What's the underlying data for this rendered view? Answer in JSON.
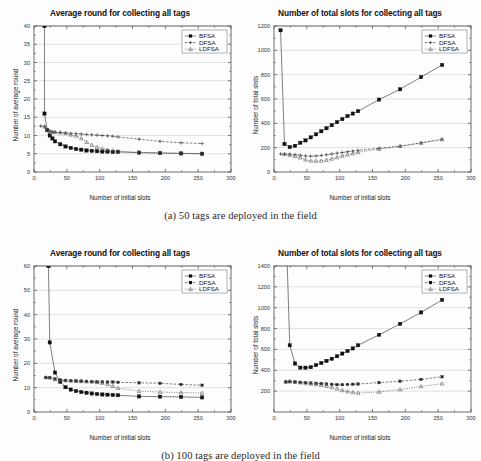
{
  "figure": {
    "caption_a": "(a)  50 tags are deployed in the field",
    "caption_b": "(b) 100 tags are deployed in the field",
    "xlabel": "Number of initial slots",
    "legend": [
      "BFSA",
      "DFSA",
      "LDFSA"
    ],
    "title_round": "Average round for collecting all tags",
    "title_slots": "Number of total slots for collecting all tags",
    "ylabel_round": "Number of average round",
    "ylabel_slots": "Number of total slots"
  },
  "chart_data": [
    {
      "id": "a-left",
      "type": "line",
      "title": "Average round for collecting all tags",
      "xlabel": "Number of initial slots",
      "ylabel": "Number of average round",
      "xlim": [
        0,
        300
      ],
      "ylim": [
        0,
        40
      ],
      "xticks": [
        0,
        50,
        100,
        150,
        200,
        250,
        300
      ],
      "yticks": [
        0,
        5,
        10,
        15,
        20,
        25,
        30,
        35,
        40
      ],
      "grid": true,
      "legend_position": "top-right",
      "series": [
        {
          "name": "BFSA",
          "marker": "filled-square",
          "x": [
            16,
            16,
            20,
            24,
            28,
            32,
            40,
            48,
            56,
            64,
            72,
            80,
            88,
            96,
            104,
            112,
            120,
            128,
            160,
            192,
            224,
            256
          ],
          "y": [
            40,
            16,
            11.5,
            10,
            9.2,
            8.4,
            7.6,
            7.0,
            6.6,
            6.3,
            6.1,
            5.9,
            5.8,
            5.7,
            5.6,
            5.6,
            5.5,
            5.5,
            5.3,
            5.2,
            5.1,
            5.0
          ]
        },
        {
          "name": "DFSA",
          "marker": "plus",
          "x": [
            10,
            16,
            20,
            24,
            28,
            32,
            40,
            48,
            56,
            64,
            72,
            80,
            88,
            96,
            104,
            112,
            120,
            128,
            160,
            192,
            224,
            256
          ],
          "y": [
            12.6,
            12.5,
            11.6,
            11.2,
            11.0,
            10.9,
            10.8,
            10.7,
            10.6,
            10.5,
            10.4,
            10.3,
            10.2,
            10.1,
            10.0,
            9.9,
            9.8,
            9.6,
            9.0,
            8.4,
            8.0,
            7.8
          ]
        },
        {
          "name": "LDFSA",
          "marker": "open-triangle",
          "x": [
            16,
            20,
            24,
            28,
            32,
            40,
            48,
            56,
            64,
            72,
            80,
            88,
            96,
            104,
            112,
            120,
            128,
            160,
            192,
            224,
            256
          ],
          "y": [
            12.4,
            11.5,
            11.2,
            11.0,
            10.9,
            10.8,
            10.6,
            10.2,
            9.9,
            9.2,
            8.2,
            7.4,
            6.8,
            6.4,
            6.1,
            5.9,
            5.7,
            5.4,
            5.2,
            5.1,
            5.0
          ]
        }
      ]
    },
    {
      "id": "a-right",
      "type": "line",
      "title": "Number of total slots for collecting all tags",
      "xlabel": "Number of initial slots",
      "ylabel": "Number of total slots",
      "xlim": [
        0,
        300
      ],
      "ylim": [
        0,
        1200
      ],
      "xticks": [
        0,
        50,
        100,
        150,
        200,
        250,
        300
      ],
      "yticks": [
        0,
        200,
        400,
        600,
        800,
        1000,
        1200
      ],
      "grid": true,
      "legend_position": "top-right",
      "series": [
        {
          "name": "BFSA",
          "marker": "filled-square",
          "x": [
            10,
            16,
            24,
            32,
            40,
            48,
            56,
            64,
            72,
            80,
            88,
            96,
            104,
            112,
            120,
            128,
            160,
            192,
            224,
            256
          ],
          "y": [
            1165,
            230,
            205,
            215,
            240,
            260,
            285,
            310,
            335,
            360,
            385,
            410,
            435,
            460,
            480,
            500,
            595,
            680,
            780,
            880
          ]
        },
        {
          "name": "DFSA",
          "marker": "plus",
          "x": [
            10,
            16,
            24,
            32,
            40,
            48,
            56,
            64,
            72,
            80,
            88,
            96,
            104,
            112,
            120,
            128,
            160,
            192,
            224,
            256
          ],
          "y": [
            148,
            148,
            147,
            143,
            138,
            132,
            130,
            132,
            136,
            142,
            148,
            155,
            160,
            166,
            172,
            178,
            195,
            212,
            240,
            270
          ]
        },
        {
          "name": "LDFSA",
          "marker": "open-triangle",
          "x": [
            16,
            24,
            32,
            40,
            48,
            56,
            64,
            72,
            80,
            88,
            96,
            104,
            112,
            120,
            128,
            160,
            192,
            224,
            256
          ],
          "y": [
            146,
            140,
            130,
            118,
            100,
            92,
            90,
            92,
            98,
            108,
            120,
            132,
            142,
            152,
            162,
            188,
            212,
            238,
            266
          ]
        }
      ]
    },
    {
      "id": "b-left",
      "type": "line",
      "title": "Average round for collecting all tags",
      "xlabel": "Number of initial slots",
      "ylabel": "Number of average round",
      "xlim": [
        0,
        300
      ],
      "ylim": [
        0,
        60
      ],
      "xticks": [
        0,
        50,
        100,
        150,
        200,
        250,
        300
      ],
      "yticks": [
        0,
        10,
        20,
        30,
        40,
        50,
        60
      ],
      "grid": true,
      "legend_position": "top-right",
      "series": [
        {
          "name": "BFSA",
          "marker": "filled-square",
          "x": [
            22,
            24,
            32,
            40,
            48,
            56,
            64,
            72,
            80,
            88,
            96,
            104,
            112,
            120,
            128,
            160,
            192,
            224,
            256
          ],
          "y": [
            60,
            28.6,
            16.2,
            12.4,
            10.2,
            9.2,
            8.6,
            8.2,
            7.9,
            7.6,
            7.4,
            7.2,
            7.1,
            7.0,
            6.9,
            6.4,
            6.3,
            6.2,
            6.0
          ]
        },
        {
          "name": "DFSA",
          "marker": "filled-square-sm",
          "x": [
            18,
            24,
            32,
            40,
            48,
            56,
            64,
            72,
            80,
            88,
            96,
            104,
            112,
            120,
            128,
            160,
            192,
            224,
            256
          ],
          "y": [
            14.2,
            14.2,
            13.6,
            13.2,
            13.0,
            12.9,
            12.8,
            12.7,
            12.6,
            12.5,
            12.4,
            12.4,
            12.3,
            12.3,
            12.2,
            12.0,
            11.8,
            11.3,
            11.0
          ]
        },
        {
          "name": "LDFSA",
          "marker": "open-triangle",
          "x": [
            18,
            24,
            32,
            40,
            48,
            56,
            64,
            72,
            80,
            88,
            96,
            104,
            112,
            120,
            128,
            160,
            192,
            224,
            256
          ],
          "y": [
            14.2,
            14.0,
            13.4,
            13.1,
            12.9,
            12.8,
            12.7,
            12.6,
            12.5,
            12.4,
            12.2,
            11.9,
            11.4,
            10.6,
            9.8,
            8.6,
            8.2,
            8.0,
            7.8
          ]
        }
      ]
    },
    {
      "id": "b-right",
      "type": "line",
      "title": "Number of total slots for collecting all tags",
      "xlabel": "Number of initial slots",
      "ylabel": "Number of total slots",
      "xlim": [
        0,
        300
      ],
      "ylim": [
        0,
        1400
      ],
      "xticks": [
        0,
        50,
        100,
        150,
        200,
        250,
        300
      ],
      "yticks": [
        200,
        400,
        600,
        800,
        1000,
        1200,
        1400
      ],
      "grid": true,
      "legend_position": "top-right",
      "series": [
        {
          "name": "BFSA",
          "marker": "filled-square",
          "x": [
            20,
            24,
            32,
            40,
            48,
            56,
            64,
            72,
            80,
            88,
            96,
            104,
            112,
            120,
            128,
            160,
            192,
            224,
            256
          ],
          "y": [
            1450,
            640,
            465,
            425,
            425,
            430,
            450,
            470,
            490,
            510,
            535,
            560,
            585,
            610,
            640,
            740,
            845,
            955,
            1075
          ]
        },
        {
          "name": "DFSA",
          "marker": "filled-square-sm",
          "x": [
            18,
            24,
            32,
            40,
            48,
            56,
            64,
            72,
            80,
            88,
            96,
            104,
            112,
            120,
            128,
            160,
            192,
            224,
            256
          ],
          "y": [
            288,
            290,
            288,
            285,
            282,
            278,
            275,
            272,
            268,
            265,
            262,
            262,
            264,
            266,
            268,
            282,
            295,
            312,
            338
          ]
        },
        {
          "name": "LDFSA",
          "marker": "open-triangle",
          "x": [
            18,
            24,
            32,
            40,
            48,
            56,
            64,
            72,
            80,
            88,
            96,
            104,
            112,
            120,
            128,
            160,
            192,
            224,
            256
          ],
          "y": [
            292,
            296,
            288,
            282,
            276,
            270,
            264,
            256,
            248,
            236,
            222,
            208,
            196,
            188,
            182,
            192,
            215,
            245,
            272
          ]
        }
      ]
    }
  ]
}
